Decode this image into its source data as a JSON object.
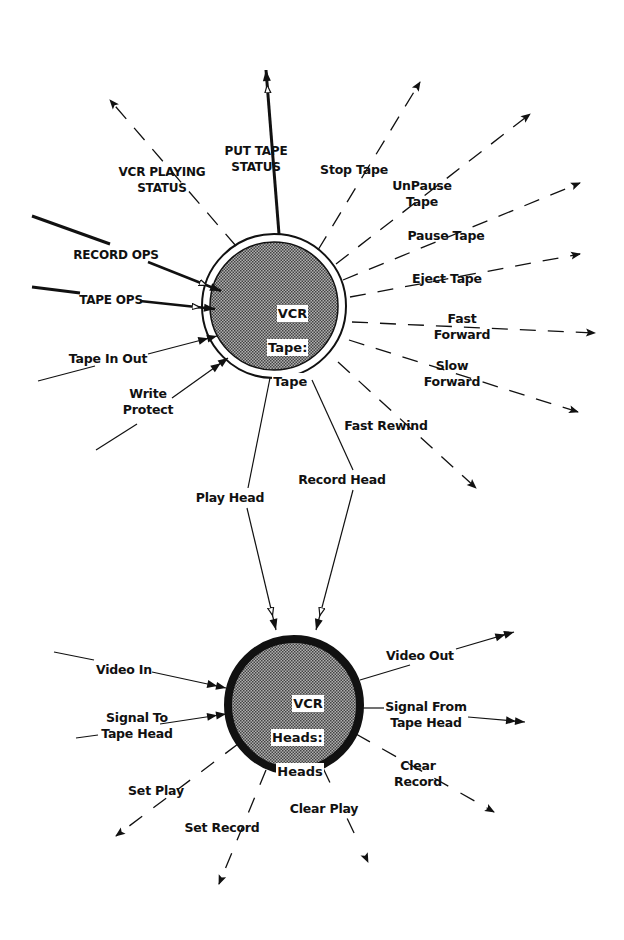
{
  "colors": {
    "ink": "#111111",
    "node_fill": "#8a8a8a",
    "background": "#ffffff"
  },
  "nodes": [
    {
      "id": "vcr-tape",
      "label_lines": [
        "VCR",
        "Tape:",
        "Tape"
      ],
      "border": "double-thin"
    },
    {
      "id": "vcr-heads",
      "label_lines": [
        "VCR",
        "Heads:",
        "Heads"
      ],
      "border": "thick"
    }
  ],
  "flows": {
    "vcr_playing_status": {
      "label": "VCR PLAYING\nSTATUS",
      "style": "dashed",
      "direction": "out",
      "node": "vcr-tape"
    },
    "put_tape_status": {
      "label": "PUT TAPE\nSTATUS",
      "style": "thick-solid",
      "direction": "out",
      "node": "vcr-tape"
    },
    "stop_tape": {
      "label": "Stop Tape",
      "style": "dashed",
      "direction": "out",
      "node": "vcr-tape"
    },
    "unpause_tape": {
      "label": "UnPause\nTape",
      "style": "dashed",
      "direction": "out",
      "node": "vcr-tape"
    },
    "pause_tape": {
      "label": "Pause Tape",
      "style": "dashed",
      "direction": "out",
      "node": "vcr-tape"
    },
    "eject_tape": {
      "label": "Eject Tape",
      "style": "dashed",
      "direction": "out",
      "node": "vcr-tape"
    },
    "fast_forward": {
      "label": "Fast\nForward",
      "style": "dashed",
      "direction": "out",
      "node": "vcr-tape"
    },
    "slow_forward": {
      "label": "Slow\nForward",
      "style": "dashed",
      "direction": "out",
      "node": "vcr-tape"
    },
    "fast_rewind": {
      "label": "Fast Rewind",
      "style": "dashed",
      "direction": "out",
      "node": "vcr-tape"
    },
    "record_ops": {
      "label": "RECORD OPS",
      "style": "thick-solid",
      "direction": "in",
      "node": "vcr-tape"
    },
    "tape_ops": {
      "label": "TAPE OPS",
      "style": "thick-solid",
      "direction": "in",
      "node": "vcr-tape"
    },
    "tape_in_out": {
      "label": "Tape In Out",
      "style": "solid",
      "direction": "in",
      "node": "vcr-tape"
    },
    "write_protect": {
      "label": "Write\nProtect",
      "style": "solid",
      "direction": "in",
      "node": "vcr-tape"
    },
    "play_head": {
      "label": "Play Head",
      "style": "solid",
      "direction": "tape-to-heads"
    },
    "record_head": {
      "label": "Record Head",
      "style": "solid",
      "direction": "tape-to-heads"
    },
    "video_in": {
      "label": "Video In",
      "style": "solid",
      "direction": "in",
      "node": "vcr-heads"
    },
    "signal_to_tape_head": {
      "label": "Signal To\nTape Head",
      "style": "solid",
      "direction": "in",
      "node": "vcr-heads"
    },
    "video_out": {
      "label": "Video Out",
      "style": "solid",
      "direction": "out",
      "node": "vcr-heads"
    },
    "signal_from_tape_head": {
      "label": "Signal From\nTape Head",
      "style": "solid",
      "direction": "out",
      "node": "vcr-heads"
    },
    "clear_record": {
      "label": "Clear\nRecord",
      "style": "dashed",
      "direction": "out",
      "node": "vcr-heads"
    },
    "clear_play": {
      "label": "Clear Play",
      "style": "dashed",
      "direction": "out",
      "node": "vcr-heads"
    },
    "set_record": {
      "label": "Set Record",
      "style": "dashed",
      "direction": "out",
      "node": "vcr-heads"
    },
    "set_play": {
      "label": "Set Play",
      "style": "dashed",
      "direction": "out",
      "node": "vcr-heads"
    }
  }
}
